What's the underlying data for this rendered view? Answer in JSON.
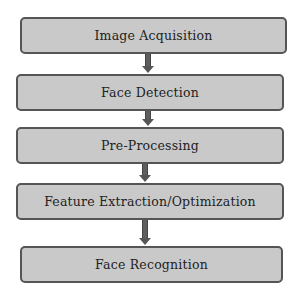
{
  "diagram": {
    "type": "flowchart",
    "direction": "top-to-bottom",
    "steps": [
      {
        "label": "Image Acquisition"
      },
      {
        "label": "Face Detection"
      },
      {
        "label": "Pre-Processing"
      },
      {
        "label": "Feature Extraction/Optimization"
      },
      {
        "label": "Face Recognition"
      }
    ],
    "colors": {
      "box_fill": "#c9c9c9",
      "box_border": "#555555",
      "arrow": "#5e5e5e"
    }
  }
}
